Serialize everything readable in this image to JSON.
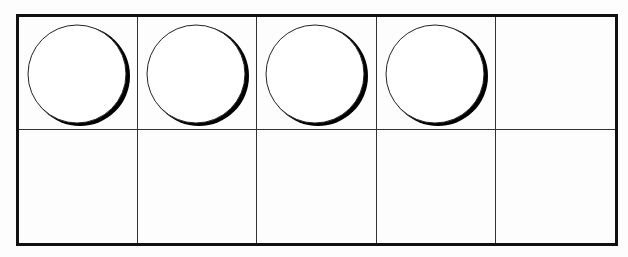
{
  "diagram": {
    "type": "ten-frame",
    "rows": 2,
    "columns": 5,
    "filled_count": 4,
    "cells": [
      {
        "row": 0,
        "col": 0,
        "counter": true
      },
      {
        "row": 0,
        "col": 1,
        "counter": true
      },
      {
        "row": 0,
        "col": 2,
        "counter": true
      },
      {
        "row": 0,
        "col": 3,
        "counter": true
      },
      {
        "row": 0,
        "col": 4,
        "counter": false
      },
      {
        "row": 1,
        "col": 0,
        "counter": false
      },
      {
        "row": 1,
        "col": 1,
        "counter": false
      },
      {
        "row": 1,
        "col": 2,
        "counter": false
      },
      {
        "row": 1,
        "col": 3,
        "counter": false
      },
      {
        "row": 1,
        "col": 4,
        "counter": false
      }
    ],
    "colors": {
      "line": "#111111",
      "counter_fill": "#ffffff",
      "counter_shadow": "#000000"
    }
  }
}
